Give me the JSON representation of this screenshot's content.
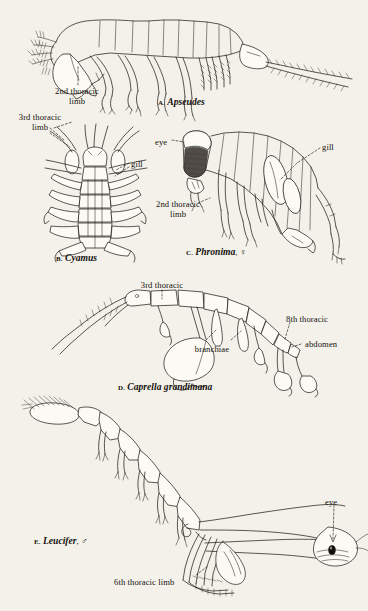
{
  "plate": {
    "background_color": "#f3f1ea",
    "ink_color": "#1b1712",
    "description": "Comparative plate of five malacostracan crustaceans with leader-line annotations"
  },
  "figures": [
    {
      "id": "a",
      "letter": "A.",
      "genus": "Apseudes",
      "sex": "",
      "caption_x": 158,
      "caption_y": 96,
      "labels": [
        {
          "name": "2nd-thoracic-limb",
          "text_line1": "2nd thoracic",
          "text_line2": "limb",
          "x": 77,
          "y": 87
        },
        {
          "name": "3rd-thoracic-limb",
          "text_line1": "3rd thoracic",
          "text_line2": "limb",
          "x": 4,
          "y": 113
        }
      ]
    },
    {
      "id": "b",
      "letter": "B.",
      "genus": "Cyamus",
      "sex": "",
      "caption_x": 56,
      "caption_y": 252,
      "labels": [
        {
          "name": "gill",
          "text_line1": "gill",
          "text_line2": "",
          "x": 131,
          "y": 160
        }
      ]
    },
    {
      "id": "c",
      "letter": "C.",
      "genus": "Phronima",
      "sex": "♀",
      "caption_x": 186,
      "caption_y": 246,
      "labels": [
        {
          "name": "eye",
          "text_line1": "eye",
          "text_line2": "",
          "x": 155,
          "y": 138
        },
        {
          "name": "gill",
          "text_line1": "gill",
          "text_line2": "",
          "x": 322,
          "y": 143
        },
        {
          "name": "2nd-thoracic-limb",
          "text_line1": "2nd thoracic",
          "text_line2": "limb",
          "x": 150,
          "y": 200
        }
      ]
    },
    {
      "id": "d",
      "letter": "D.",
      "genus": "Caprella grandimana",
      "sex": "",
      "caption_x": 118,
      "caption_y": 381,
      "labels": [
        {
          "name": "3rd-thoracic",
          "text_line1": "3rd thoracic",
          "text_line2": "",
          "x": 131,
          "y": 281
        },
        {
          "name": "branchiae",
          "text_line1": "branchiae",
          "text_line2": "",
          "x": 182,
          "y": 345
        },
        {
          "name": "8th-thoracic",
          "text_line1": "8th thoracic",
          "text_line2": "",
          "x": 286,
          "y": 315
        },
        {
          "name": "abdomen",
          "text_line1": "abdomen",
          "text_line2": "",
          "x": 305,
          "y": 340
        }
      ]
    },
    {
      "id": "e",
      "letter": "E.",
      "genus": "Leucifer",
      "sex": "♂",
      "caption_x": 34,
      "caption_y": 535,
      "labels": [
        {
          "name": "eye",
          "text_line1": "eye",
          "text_line2": "",
          "x": 325,
          "y": 498
        },
        {
          "name": "6th-thoracic-limb",
          "text_line1": "6th thoracic limb",
          "text_line2": "",
          "x": 114,
          "y": 578
        }
      ]
    }
  ]
}
